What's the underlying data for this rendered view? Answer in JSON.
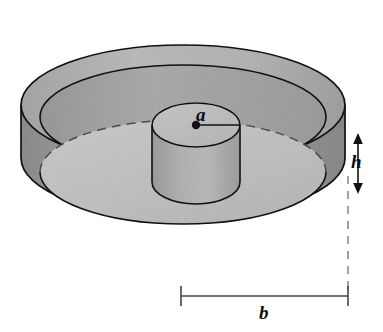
{
  "figure": {
    "background_color": "#ffffff",
    "line_color": "#111111",
    "colors": {
      "outer_side_wall": "#9a9a9a",
      "rim_top_band": "#b4b4b4",
      "inner_rim_wall": "#a5a5a5",
      "inner_floor": "#c2c2c2",
      "hub_top": "#c0c0c0",
      "hub_side": "#ababab",
      "dashed_line": "#8c8c8c",
      "outline": "#111111"
    },
    "labels": [
      {
        "id": "radius-a",
        "text": "a",
        "meaning": "radius of the inner cylinder",
        "style": "italic"
      },
      {
        "id": "height-h",
        "text": "h",
        "meaning": "thickness of the disk",
        "style": "italic"
      },
      {
        "id": "radius-b",
        "text": "b",
        "meaning": "outer radius of the disk",
        "style": "italic"
      }
    ],
    "annotations": {
      "center_dot": "marks the axis of the inner cylinder",
      "radius_leader_line": "solid line from center dot to edge of hub top",
      "height_arrow": "vertical double-headed arrow at the right edge",
      "width_dimension_line": "horizontal line with end ticks below the disk",
      "dashed_vertical": "dashed projection line from disk edge down to the b dimension line",
      "dashed_arc": "hidden back edge of the disk floor"
    }
  }
}
